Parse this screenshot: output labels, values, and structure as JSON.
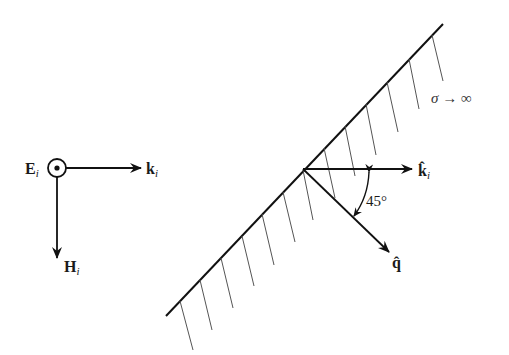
{
  "figure": {
    "incident_triad": {
      "E_label": "E",
      "E_sub": "i",
      "E_symbol": "out-of-page (dot in circle)",
      "k_label": "k",
      "k_sub": "i",
      "H_label": "H",
      "H_sub": "i"
    },
    "conductor": {
      "label": "σ → ∞",
      "hatch_count": 13
    },
    "reflection": {
      "k_hat_label": "k̂",
      "k_hat_sub": "i",
      "q_hat_label": "q̂",
      "angle_label": "45°"
    },
    "colors": {
      "line": "#111111",
      "hatch": "#555555",
      "background": "#ffffff"
    }
  }
}
